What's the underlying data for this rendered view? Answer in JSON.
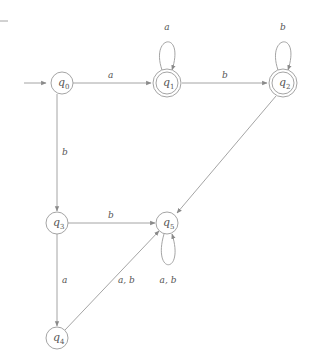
{
  "diagram": {
    "type": "finite-automaton",
    "states": [
      {
        "id": "q0",
        "name": "q",
        "sub": "0",
        "accepting": false,
        "initial": true
      },
      {
        "id": "q1",
        "name": "q",
        "sub": "1",
        "accepting": true,
        "initial": false
      },
      {
        "id": "q2",
        "name": "q",
        "sub": "2",
        "accepting": true,
        "initial": false
      },
      {
        "id": "q3",
        "name": "q",
        "sub": "3",
        "accepting": false,
        "initial": false
      },
      {
        "id": "q4",
        "name": "q",
        "sub": "4",
        "accepting": false,
        "initial": false
      },
      {
        "id": "q5",
        "name": "q",
        "sub": "5",
        "accepting": false,
        "initial": false
      }
    ],
    "transitions": [
      {
        "from": "q0",
        "to": "q1",
        "label": "a"
      },
      {
        "from": "q1",
        "to": "q1",
        "label": "a"
      },
      {
        "from": "q1",
        "to": "q2",
        "label": "b"
      },
      {
        "from": "q2",
        "to": "q2",
        "label": "b"
      },
      {
        "from": "q2",
        "to": "q5",
        "label": ""
      },
      {
        "from": "q0",
        "to": "q3",
        "label": "b"
      },
      {
        "from": "q3",
        "to": "q5",
        "label": "b"
      },
      {
        "from": "q3",
        "to": "q4",
        "label": "a"
      },
      {
        "from": "q4",
        "to": "q5",
        "label": "a, b"
      },
      {
        "from": "q5",
        "to": "q5",
        "label": "a, b"
      }
    ]
  }
}
